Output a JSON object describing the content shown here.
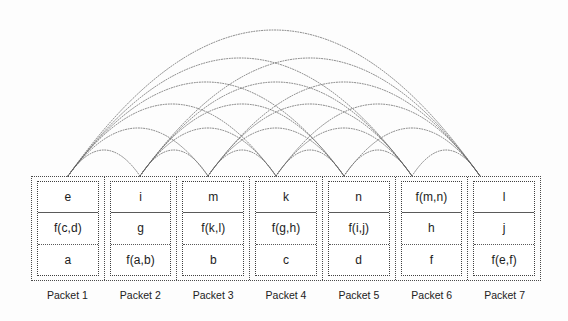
{
  "diagram": {
    "background_color": "#fdfdfd",
    "line_color": "#5b5b5b",
    "text_color": "#1c1c1c",
    "packet_count": 7,
    "cells_per_packet": 3
  },
  "packets": [
    {
      "label": "Packet 1",
      "cells": [
        {
          "text": "e"
        },
        {
          "text": "f(c,d)"
        },
        {
          "text": "a"
        }
      ]
    },
    {
      "label": "Packet 2",
      "cells": [
        {
          "text": "i"
        },
        {
          "text": "g"
        },
        {
          "text": "f(a,b)"
        }
      ]
    },
    {
      "label": "Packet 3",
      "cells": [
        {
          "text": "m"
        },
        {
          "text": "f(k,l)"
        },
        {
          "text": "b"
        }
      ]
    },
    {
      "label": "Packet 4",
      "cells": [
        {
          "text": "k"
        },
        {
          "text": "f(g,h)"
        },
        {
          "text": "c"
        }
      ]
    },
    {
      "label": "Packet 5",
      "cells": [
        {
          "text": "n"
        },
        {
          "text": "f(i,j)"
        },
        {
          "text": "d"
        }
      ]
    },
    {
      "label": "Packet 6",
      "cells": [
        {
          "text": "f(m,n)"
        },
        {
          "text": "h"
        },
        {
          "text": "f"
        }
      ]
    },
    {
      "label": "Packet 7",
      "cells": [
        {
          "text": "l"
        },
        {
          "text": "j"
        },
        {
          "text": "f(e,f)"
        }
      ]
    }
  ],
  "arc_nodes_x": [
    68,
    140,
    208,
    276,
    344,
    412,
    480
  ],
  "arc_baseline_y": 176,
  "arcs": [
    {
      "from": 0,
      "to": 1,
      "apex_y": 150
    },
    {
      "from": 1,
      "to": 2,
      "apex_y": 150
    },
    {
      "from": 2,
      "to": 3,
      "apex_y": 150
    },
    {
      "from": 3,
      "to": 4,
      "apex_y": 150
    },
    {
      "from": 4,
      "to": 5,
      "apex_y": 150
    },
    {
      "from": 5,
      "to": 6,
      "apex_y": 150
    },
    {
      "from": 0,
      "to": 2,
      "apex_y": 128
    },
    {
      "from": 1,
      "to": 3,
      "apex_y": 128
    },
    {
      "from": 2,
      "to": 4,
      "apex_y": 128
    },
    {
      "from": 3,
      "to": 5,
      "apex_y": 128
    },
    {
      "from": 4,
      "to": 6,
      "apex_y": 128
    },
    {
      "from": 0,
      "to": 3,
      "apex_y": 104
    },
    {
      "from": 1,
      "to": 4,
      "apex_y": 104
    },
    {
      "from": 2,
      "to": 5,
      "apex_y": 104
    },
    {
      "from": 3,
      "to": 6,
      "apex_y": 104
    },
    {
      "from": 0,
      "to": 4,
      "apex_y": 82
    },
    {
      "from": 1,
      "to": 5,
      "apex_y": 82
    },
    {
      "from": 2,
      "to": 6,
      "apex_y": 82
    },
    {
      "from": 0,
      "to": 5,
      "apex_y": 58
    },
    {
      "from": 1,
      "to": 6,
      "apex_y": 58
    },
    {
      "from": 0,
      "to": 6,
      "apex_y": 30
    }
  ]
}
